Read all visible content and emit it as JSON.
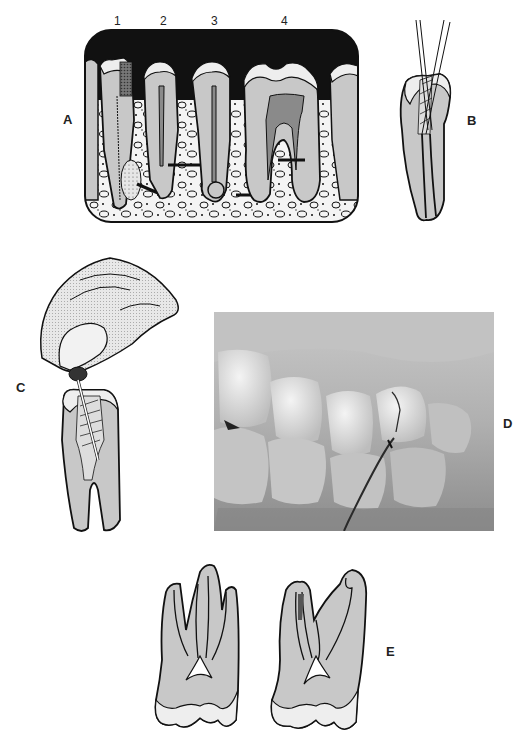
{
  "figure": {
    "panels": [
      {
        "id": "A",
        "label": "A",
        "description": "Cross-section of posterior teeth in alveolar bone showing four endodontic conditions",
        "tooth_numbers": [
          "1",
          "2",
          "3",
          "4"
        ]
      },
      {
        "id": "B",
        "label": "B",
        "description": "Tooth with two crossing instruments in canal"
      },
      {
        "id": "C",
        "label": "C",
        "description": "Gloved fingers holding instrument in root canal of extracted tooth"
      },
      {
        "id": "D",
        "label": "D",
        "description": "Clinical photograph of maxillary teeth with periodontal probe"
      },
      {
        "id": "E",
        "label": "E",
        "description": "Two sectioned maxillary molars showing root canal anatomy"
      }
    ]
  },
  "colors": {
    "ink": "#111111",
    "dentin": "#c8c8c8",
    "enamel": "#eeeeee",
    "pulp_dark": "#8a8a8a",
    "bone_bg": "#f4f4f4",
    "photo_base": "#9a9a9a"
  }
}
